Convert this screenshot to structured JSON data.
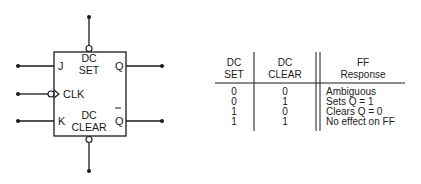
{
  "diagram": {
    "box_labels": {
      "j": "J",
      "k": "K",
      "clk": "CLK",
      "q": "Q",
      "qbar": "Q",
      "set_line1": "DC",
      "set_line2": "SET",
      "clear_line1": "DC",
      "clear_line2": "CLEAR"
    }
  },
  "table": {
    "headers": [
      {
        "line1": "DC",
        "line2": "SET"
      },
      {
        "line1": "DC",
        "line2": "CLEAR"
      },
      {
        "line1": "FF",
        "line2": "Response"
      }
    ],
    "rows": [
      {
        "set": "0",
        "clear": "0",
        "response": "Ambiguous"
      },
      {
        "set": "0",
        "clear": "1",
        "response": "Sets Q = 1"
      },
      {
        "set": "1",
        "clear": "0",
        "response": "Clears Q = 0"
      },
      {
        "set": "1",
        "clear": "1",
        "response": "No effect on FF"
      }
    ]
  }
}
